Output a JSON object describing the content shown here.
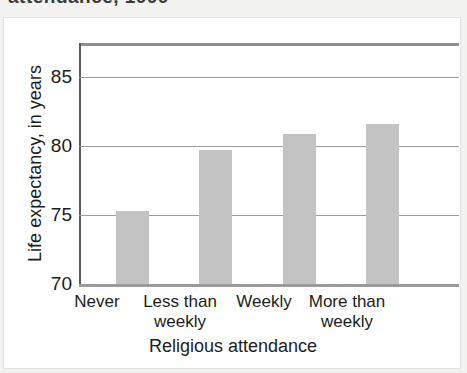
{
  "cropped_header_text": "attendance, 1999",
  "chart_data": {
    "type": "bar",
    "title": "",
    "xlabel": "Religious attendance",
    "ylabel": "Life expectancy, in years",
    "categories": [
      "Never",
      "Less than weekly",
      "Weekly",
      "More than weekly"
    ],
    "category_lines": [
      [
        "Never"
      ],
      [
        "Less than",
        "weekly"
      ],
      [
        "Weekly"
      ],
      [
        "More than",
        "weekly"
      ]
    ],
    "values": [
      75.3,
      79.7,
      80.9,
      81.6
    ],
    "ylim": [
      70,
      87.5
    ],
    "yticks": [
      70,
      75,
      80,
      85
    ],
    "ytick_labels": [
      "70",
      "75",
      "80",
      "85"
    ],
    "gridlines": [
      75,
      80,
      85
    ],
    "grid": true,
    "legend": "none",
    "bar_color": "#c3c3c3",
    "gridline_color": "#9b9b9b",
    "axis_color": "#5a5a5a",
    "text_color": "#1c1c1c",
    "background_color": "#ffffff"
  }
}
